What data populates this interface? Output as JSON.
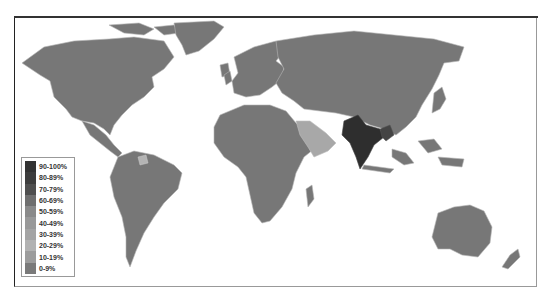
{
  "map": {
    "type": "choropleth",
    "subject": "world map with countries shaded by percentage bands",
    "highlighted_regions": [
      {
        "name": "India",
        "band": "90-100%",
        "color": "#2e2e2e"
      },
      {
        "name": "Bangladesh/Myanmar region",
        "band": "70-79%",
        "color": "#555555"
      },
      {
        "name": "Arabian Peninsula",
        "band": "30-39%",
        "color": "#a8a8a8"
      },
      {
        "name": "Suriname/Guyana",
        "band": "20-29%",
        "color": "#b4b4b4"
      }
    ],
    "default_land_color": "#777777",
    "border_color": "#b0b0b0",
    "ocean_color": "#ffffff"
  },
  "legend": {
    "items": [
      {
        "label": "90-100%",
        "color": "#333333"
      },
      {
        "label": "80-89%",
        "color": "#3d3d3d"
      },
      {
        "label": "70-79%",
        "color": "#4f4f4f"
      },
      {
        "label": "60-69%",
        "color": "#6f6f6f"
      },
      {
        "label": "50-59%",
        "color": "#8a8a8a"
      },
      {
        "label": "40-49%",
        "color": "#999999"
      },
      {
        "label": "30-39%",
        "color": "#a4a4a4"
      },
      {
        "label": "20-29%",
        "color": "#b2b2b2"
      },
      {
        "label": "10-19%",
        "color": "#9c9c9c"
      },
      {
        "label": "0-9%",
        "color": "#7a7a7a"
      }
    ]
  }
}
